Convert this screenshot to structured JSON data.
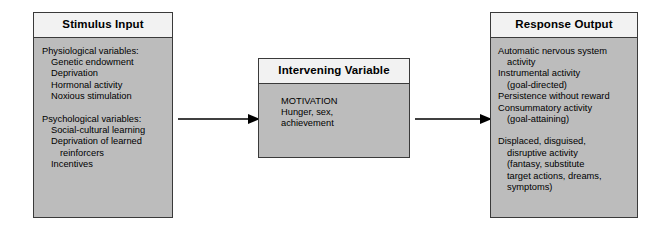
{
  "diagram": {
    "background_color": "#ffffff",
    "box_fill_color": "#bcbcbc",
    "header_fill_color": "#f2f2f2",
    "border_color": "#3a3a3a",
    "arrow_color": "#000000"
  },
  "stimulus": {
    "header": "Stimulus Input",
    "lines": [
      {
        "text": "Physiological variables:",
        "indent": 0
      },
      {
        "text": "Genetic endowment",
        "indent": 1
      },
      {
        "text": "Deprivation",
        "indent": 1
      },
      {
        "text": "Hormonal activity",
        "indent": 1
      },
      {
        "text": "Noxious stimulation",
        "indent": 1
      },
      {
        "text": "",
        "indent": 0
      },
      {
        "text": "Psychological variables:",
        "indent": 0
      },
      {
        "text": "Social-cultural learning",
        "indent": 1
      },
      {
        "text": "Deprivation of learned",
        "indent": 1
      },
      {
        "text": "reinforcers",
        "indent": 2
      },
      {
        "text": "Incentives",
        "indent": 1
      }
    ]
  },
  "intervening": {
    "header": "Intervening Variable",
    "lines": [
      {
        "text": "MOTIVATION",
        "indent": 0
      },
      {
        "text": "Hunger, sex,",
        "indent": 0
      },
      {
        "text": "achievement",
        "indent": 0
      }
    ]
  },
  "response": {
    "header": "Response Output",
    "lines": [
      {
        "text": "Automatic nervous system",
        "indent": 0
      },
      {
        "text": "activity",
        "indent": 1
      },
      {
        "text": "Instrumental activity",
        "indent": 0
      },
      {
        "text": "(goal-directed)",
        "indent": 1
      },
      {
        "text": "Persistence without reward",
        "indent": 0
      },
      {
        "text": "Consummatory activity",
        "indent": 0
      },
      {
        "text": "(goal-attaining)",
        "indent": 1
      },
      {
        "text": "",
        "indent": 0
      },
      {
        "text": "Displaced, disguised,",
        "indent": 0
      },
      {
        "text": "disruptive activity",
        "indent": 1
      },
      {
        "text": "(fantasy, substitute",
        "indent": 1
      },
      {
        "text": "target actions, dreams,",
        "indent": 1
      },
      {
        "text": "symptoms)",
        "indent": 1
      }
    ]
  },
  "arrows": [
    {
      "name": "stimulus-to-intervening"
    },
    {
      "name": "intervening-to-response"
    }
  ]
}
